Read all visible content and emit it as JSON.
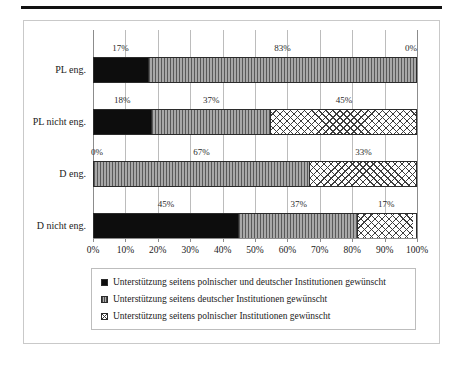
{
  "chart_data": {
    "type": "bar",
    "orientation": "horizontal",
    "stacked": true,
    "title": "",
    "xlabel": "",
    "ylabel": "",
    "xlim": [
      0,
      100
    ],
    "grid": true,
    "legend_position": "bottom",
    "categories": [
      "PL eng.",
      "PL nicht eng.",
      "D eng.",
      "D nicht eng."
    ],
    "tick_labels": [
      "0%",
      "10%",
      "20%",
      "30%",
      "40%",
      "50%",
      "60%",
      "70%",
      "80%",
      "90%",
      "100%"
    ],
    "tick_values": [
      0,
      10,
      20,
      30,
      40,
      50,
      60,
      70,
      80,
      90,
      100
    ],
    "series": [
      {
        "name": "Unterstützung seitens polnischer und deutscher Institutionen gewünscht",
        "pattern": "solid-black",
        "values": [
          17,
          18,
          0,
          45
        ],
        "labels": [
          "17%",
          "18%",
          "0%",
          "45%"
        ]
      },
      {
        "name": "Unterstützung seitens deutscher Institutionen gewünscht",
        "pattern": "vertical-stripes",
        "values": [
          83,
          37,
          67,
          37
        ],
        "labels": [
          "83%",
          "37%",
          "67%",
          "37%"
        ]
      },
      {
        "name": "Unterstützung seitens polnischer Institutionen gewünscht",
        "pattern": "diagonal-crosshatch",
        "values": [
          0,
          45,
          33,
          17
        ],
        "labels": [
          "0%",
          "45%",
          "33%",
          "17%"
        ]
      }
    ]
  },
  "legend": {
    "items": [
      {
        "label": "Unterstützung seitens polnischer und deutscher Institutionen gewünscht"
      },
      {
        "label": "Unterstützung seitens deutscher Institutionen gewünscht"
      },
      {
        "label": "Unterstützung seitens polnischer Institutionen gewünscht"
      }
    ]
  },
  "colors": {
    "series1": "#0d0d0d",
    "series2": "#8d8d8d",
    "series3": "#ffffff",
    "gridline": "#bcbcbc",
    "axis": "#8c8c8c",
    "frame": "#c9c9c9",
    "rule": "#111111"
  }
}
